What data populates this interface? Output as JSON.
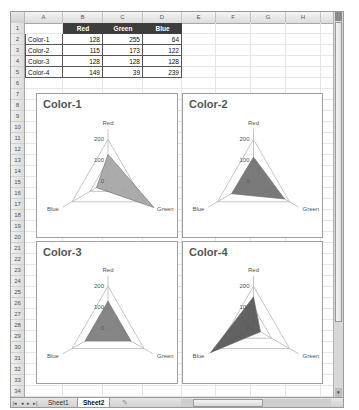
{
  "spreadsheet": {
    "columns": [
      "A",
      "B",
      "C",
      "D",
      "E",
      "F",
      "G",
      "H"
    ],
    "rows": [
      "1",
      "2",
      "3",
      "4",
      "5",
      "6",
      "7",
      "8",
      "9",
      "10",
      "11",
      "12",
      "13",
      "14",
      "15",
      "16",
      "17",
      "18",
      "19",
      "20",
      "21",
      "22",
      "23",
      "24",
      "25",
      "26",
      "27",
      "28",
      "29",
      "30",
      "31",
      "32",
      "33",
      "34"
    ],
    "table": {
      "headers": [
        "",
        "Red",
        "Green",
        "Blue"
      ],
      "rows": [
        {
          "label": "Color-1",
          "red": "128",
          "green": "255",
          "blue": "64"
        },
        {
          "label": "Color-2",
          "red": "115",
          "green": "173",
          "blue": "122"
        },
        {
          "label": "Color-3",
          "red": "128",
          "green": "128",
          "blue": "128"
        },
        {
          "label": "Color-4",
          "red": "149",
          "green": "39",
          "blue": "239"
        }
      ]
    }
  },
  "sheet_tabs": {
    "nav": [
      "|◂",
      "◂",
      "▸",
      "▸|"
    ],
    "tabs": [
      {
        "label": "Sheet1",
        "active": false
      },
      {
        "label": "Sheet2",
        "active": true
      }
    ]
  },
  "chart_data": [
    {
      "type": "radar",
      "title": "Color-1",
      "categories": [
        "Red",
        "Green",
        "Blue"
      ],
      "values": [
        128,
        255,
        64
      ],
      "axis_ticks": [
        "0",
        "100",
        "200"
      ],
      "ylim": [
        0,
        250
      ],
      "fill": "#a6a6a6"
    },
    {
      "type": "radar",
      "title": "Color-2",
      "categories": [
        "Red",
        "Green",
        "Blue"
      ],
      "values": [
        115,
        173,
        122
      ],
      "axis_ticks": [
        "0",
        "100",
        "200"
      ],
      "ylim": [
        0,
        250
      ],
      "fill": "#737373"
    },
    {
      "type": "radar",
      "title": "Color-3",
      "categories": [
        "Red",
        "Green",
        "Blue"
      ],
      "values": [
        128,
        128,
        128
      ],
      "axis_ticks": [
        "0",
        "100",
        "200"
      ],
      "ylim": [
        0,
        250
      ],
      "fill": "#7f7f7f"
    },
    {
      "type": "radar",
      "title": "Color-4",
      "categories": [
        "Red",
        "Green",
        "Blue"
      ],
      "values": [
        149,
        39,
        239
      ],
      "axis_ticks": [
        "0",
        "100",
        "200"
      ],
      "ylim": [
        0,
        250
      ],
      "fill": "#5a5a5a"
    }
  ]
}
